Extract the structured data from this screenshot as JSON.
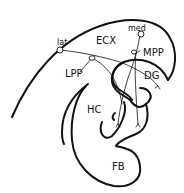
{
  "diagram": {
    "type": "neuroanatomy-schematic",
    "labels": {
      "ecx": "ECX",
      "med": "med",
      "lat": "lat",
      "mpp": "MPP",
      "lpp": "LPP",
      "dg": "DG",
      "hc": "HC",
      "fb": "FB"
    },
    "colors": {
      "stroke": "#111111",
      "background": "#ffffff"
    }
  }
}
